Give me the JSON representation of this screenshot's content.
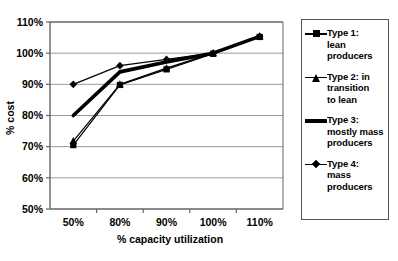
{
  "chart_data": {
    "type": "line",
    "title": "",
    "xlabel": "% capacity utilization",
    "ylabel": "% cost",
    "categories": [
      "50%",
      "80%",
      "90%",
      "100%",
      "110%"
    ],
    "ytick_labels": [
      "50%",
      "60%",
      "70%",
      "80%",
      "90%",
      "100%",
      "110%"
    ],
    "ytick_values": [
      50,
      60,
      70,
      80,
      90,
      100,
      110
    ],
    "ylim": [
      50,
      110
    ],
    "grid": "horizontal",
    "legend_position": "right-outside",
    "series": [
      {
        "name": "Type 1: lean producers",
        "legend_label_lines": [
          "Type 1:",
          "lean",
          "producers"
        ],
        "marker": "square",
        "line_weight": "thin",
        "color": "#000000",
        "values": [
          70.5,
          89.8,
          94.8,
          99.8,
          105.2
        ]
      },
      {
        "name": "Type 2: in transition to lean",
        "legend_label_lines": [
          "Type 2: in",
          "transition",
          "to lean"
        ],
        "marker": "triangle",
        "line_weight": "thin",
        "color": "#000000",
        "values": [
          71.8,
          90.0,
          95.2,
          100.0,
          105.4
        ]
      },
      {
        "name": "Type 3: mostly mass producers",
        "legend_label_lines": [
          "Type 3:",
          "mostly mass",
          "producers"
        ],
        "marker": "none",
        "line_weight": "thick",
        "color": "#000000",
        "values": [
          80.0,
          94.0,
          97.2,
          100.0,
          105.4
        ]
      },
      {
        "name": "Type 4: mass producers",
        "legend_label_lines": [
          "Type 4:",
          "mass",
          "producers"
        ],
        "marker": "diamond",
        "line_weight": "thin",
        "color": "#000000",
        "values": [
          90.0,
          96.0,
          98.0,
          100.0,
          105.4
        ]
      }
    ]
  },
  "axes": {
    "y_title": "% cost",
    "x_title": "% capacity utilization"
  },
  "colors": {
    "series": "#000000",
    "gridline": "#9a9a9a",
    "axis": "#666666",
    "legend_border": "#555555",
    "background": "#ffffff"
  }
}
